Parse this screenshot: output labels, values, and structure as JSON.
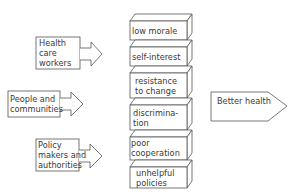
{
  "diagram": {
    "sources": [
      {
        "label_lines": [
          "Health",
          "care",
          "workers"
        ]
      },
      {
        "label_lines": [
          "People and",
          "communities"
        ]
      },
      {
        "label_lines": [
          "Policy",
          "makers and",
          "authorities"
        ]
      }
    ],
    "barriers": [
      {
        "label_lines": [
          "low morale"
        ]
      },
      {
        "label_lines": [
          "self-interest"
        ]
      },
      {
        "label_lines": [
          "resistance",
          "to change"
        ]
      },
      {
        "label_lines": [
          "discrimina-",
          "tion"
        ]
      },
      {
        "label_lines": [
          "poor",
          "cooperation"
        ]
      },
      {
        "label_lines": [
          "unhelpful",
          "policies"
        ]
      }
    ],
    "outcome": {
      "label": "Better health"
    },
    "colors": {
      "stroke": "#555555",
      "text": "#3a3a3a",
      "background": "#ffffff"
    }
  }
}
